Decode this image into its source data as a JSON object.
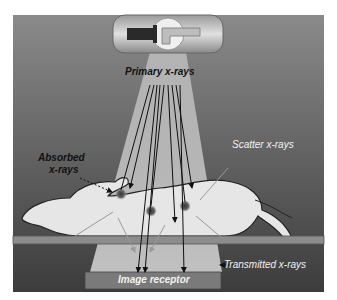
{
  "diagram": {
    "labels": {
      "primary": "Primary x-rays",
      "absorbed_line1": "Absorbed",
      "absorbed_line2": "x-rays",
      "scatter": "Scatter x-rays",
      "transmitted": "Transmitted x-rays",
      "receptor": "Image receptor"
    },
    "components": [
      "x-ray-tube",
      "primary-beam",
      "patient-body",
      "table",
      "image-receptor"
    ],
    "colors": {
      "background": "#6e6e6e",
      "beam": "#cfcfcf",
      "body": "#e4e4e4",
      "table": "#8c8c8c",
      "receptor": "#7a7a7a"
    }
  }
}
